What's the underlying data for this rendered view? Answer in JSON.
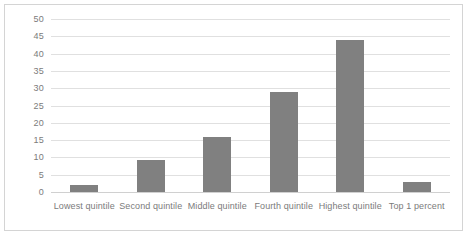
{
  "chart_data": {
    "type": "bar",
    "title": "",
    "subtitle": "",
    "xlabel": "",
    "ylabel": "",
    "categories": [
      "Lowest quintile",
      "Second quintile",
      "Middle quintile",
      "Fourth quintile",
      "Highest quintile",
      "Top 1 percent"
    ],
    "values": [
      2,
      9.3,
      16,
      29,
      44,
      3
    ],
    "ylim": [
      0,
      50
    ],
    "ytick_step": 5,
    "yticks": [
      50,
      45,
      40,
      35,
      30,
      25,
      20,
      15,
      10,
      5,
      0
    ],
    "grid": true,
    "legend": false,
    "legend_position": "none",
    "series": [
      {
        "name": "",
        "values": [
          2,
          9.3,
          16,
          29,
          44,
          3
        ]
      }
    ]
  },
  "style": {
    "bar_color": "#808080",
    "gridline_color": "#e0e0e0",
    "border_color": "#d4d4d4",
    "label_color": "#7b7b7b",
    "background": "#ffffff"
  }
}
